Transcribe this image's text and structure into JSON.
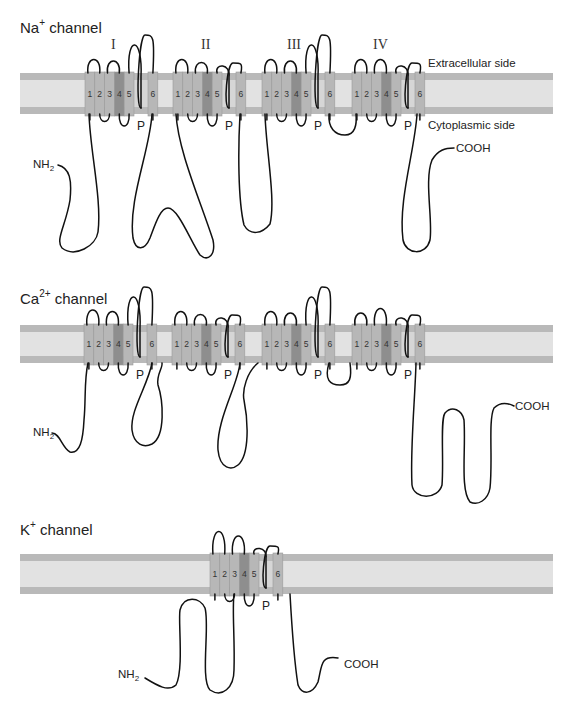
{
  "figure": {
    "panels": [
      {
        "id": "na",
        "title_main": "Na",
        "title_sup": "+",
        "title_rest": " channel",
        "domains": [
          "I",
          "II",
          "III",
          "IV"
        ],
        "side_labels": {
          "extracellular": "Extracellular side",
          "cytoplasmic": "Cytoplasmic side"
        },
        "termini": {
          "n": "NH",
          "n_sub": "2",
          "c": "COOH"
        },
        "pore_label": "P"
      },
      {
        "id": "ca",
        "title_main": "Ca",
        "title_sup": "2+",
        "title_rest": " channel",
        "domains": [
          "I",
          "II",
          "III",
          "IV"
        ],
        "termini": {
          "n": "NH",
          "n_sub": "2",
          "c": "COOH"
        },
        "pore_label": "P"
      },
      {
        "id": "k",
        "title_main": "K",
        "title_sup": "+",
        "title_rest": " channel",
        "domains": [
          "single"
        ],
        "termini": {
          "n": "NH",
          "n_sub": "2",
          "c": "COOH"
        },
        "pore_label": "P"
      }
    ],
    "segment_labels": [
      "1",
      "2",
      "3",
      "4",
      "5",
      "6"
    ],
    "colors": {
      "membrane_band": "#b9b9b9",
      "membrane_core": "#e2e2e2",
      "segment": "#b7b7b7",
      "segment_s4": "#8e8e8e",
      "segment_border": "#9a9a9a",
      "chain": "#111111"
    }
  }
}
